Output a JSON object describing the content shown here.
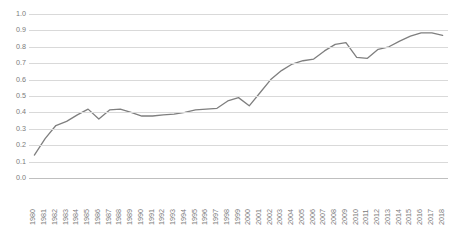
{
  "chart_data": {
    "type": "line",
    "title": "",
    "subtitle": "",
    "xlabel": "",
    "ylabel": "",
    "grid": true,
    "legend": false,
    "legend_position": "none",
    "line_color": "#7f7f7f",
    "background_color": "#ffffff",
    "gridline_color": "#d9d9d9",
    "tick_label_color": "#7b7b7b",
    "xlim": [
      "1980",
      "2018"
    ],
    "ylim": [
      0.0,
      1.0
    ],
    "ytick_labels": [
      "1.0",
      "0.9",
      "0.8",
      "0.7",
      "0.6",
      "0.5",
      "0.4",
      "0.3",
      "0.2",
      "0.1",
      "0.0"
    ],
    "ytick_values": [
      1.0,
      0.9,
      0.8,
      0.7,
      0.6,
      0.5,
      0.4,
      0.3,
      0.2,
      0.1,
      0.0
    ],
    "categories": [
      "1980",
      "1981",
      "1982",
      "1983",
      "1984",
      "1985",
      "1986",
      "1987",
      "1988",
      "1989",
      "1990",
      "1991",
      "1992",
      "1993",
      "1994",
      "1995",
      "1996",
      "1997",
      "1998",
      "1999",
      "2000",
      "2001",
      "2002",
      "2003",
      "2004",
      "2005",
      "2006",
      "2007",
      "2008",
      "2009",
      "2010",
      "2011",
      "2012",
      "2013",
      "2014",
      "2015",
      "2016",
      "2017",
      "2018"
    ],
    "values": [
      0.14,
      0.24,
      0.32,
      0.345,
      0.385,
      0.42,
      0.36,
      0.415,
      0.42,
      0.4,
      0.378,
      0.378,
      0.385,
      0.39,
      0.4,
      0.415,
      0.42,
      0.425,
      0.47,
      0.49,
      0.44,
      0.52,
      0.6,
      0.655,
      0.695,
      0.715,
      0.725,
      0.775,
      0.815,
      0.825,
      0.735,
      0.73,
      0.785,
      0.8,
      0.835,
      0.865,
      0.885,
      0.885,
      0.87
    ]
  }
}
